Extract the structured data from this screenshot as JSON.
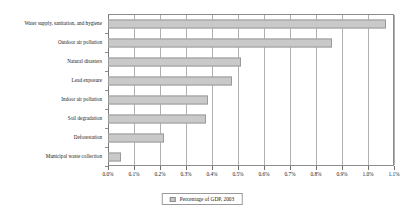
{
  "chart_data": {
    "type": "bar",
    "orientation": "horizontal",
    "title": "",
    "xlabel": "",
    "ylabel": "",
    "xlim": [
      0,
      1.1
    ],
    "xtick_step": 0.1,
    "xticks": [
      "0.0%",
      "0.1%",
      "0.2%",
      "0.3%",
      "0.4%",
      "0.5%",
      "0.6%",
      "0.7%",
      "0.8%",
      "0.9%",
      "1.0%",
      "1.1%"
    ],
    "xtick_values": [
      0.0,
      0.1,
      0.2,
      0.3,
      0.4,
      0.5,
      0.6,
      0.7,
      0.8,
      0.9,
      1.0,
      1.1
    ],
    "grid": true,
    "grid_axis": "x",
    "legend_position": "bottom-center",
    "categories": [
      "Water supply, sanitation, and hygiene",
      "Outdoor air pollution",
      "Natural disasters",
      "Lead exposure",
      "Indoor air pollution",
      "Soil degradation",
      "Deforestation",
      "Municipal waste collection"
    ],
    "series": [
      {
        "name": "Percentage of GDP, 2003",
        "values": [
          1.07,
          0.86,
          0.51,
          0.475,
          0.385,
          0.375,
          0.215,
          0.05
        ],
        "color": "#c9c9c9"
      }
    ]
  },
  "legend": {
    "label": "Percentage of GDP, 2003"
  },
  "colors": {
    "bar_fill": "#c9c9c9",
    "bar_border": "#9a9a9a",
    "gridline": "#b0b0b0",
    "axis": "#8c8c8c",
    "text": "#1a1a1a"
  }
}
